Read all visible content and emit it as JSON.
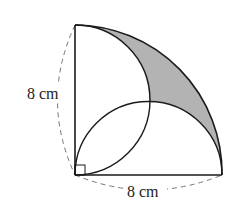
{
  "figure": {
    "labels": {
      "left_side": "8 cm",
      "bottom_side": "8 cm"
    },
    "colors": {
      "stroke": "#1a1a1a",
      "shaded_region": "#b3b3b3",
      "dashed": "#777777",
      "background": "#ffffff"
    },
    "shapes": {
      "quarter_circle": "radius 8 cm centered at right-angle corner",
      "semicircle_left": "diameter along left 8 cm side",
      "semicircle_bottom": "diameter along bottom 8 cm side",
      "right_angle_marker": true,
      "shaded": "region between quarter arc and both semicircle arcs near top-right"
    }
  }
}
